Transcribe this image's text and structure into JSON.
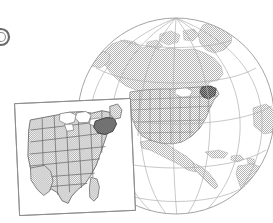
{
  "figure": {
    "title": "Globe showing North America with inset map of the eastern and central United States",
    "caption": "",
    "background_color": "#ffffff"
  },
  "marker": {
    "name": "figure-bullet-marker",
    "label": "",
    "shape": "circle-outline-cropped",
    "color": "#6b6b6b",
    "center_x": 1,
    "center_y": 37,
    "radius": 8
  },
  "globe": {
    "label": "Earth globe, North America centered",
    "center_x": 176,
    "center_y": 116,
    "radius": 98,
    "outline_color": "#9a9a9a",
    "ocean_color": "#ffffff",
    "land_color": "#c9c9c9",
    "graticule_color": "#b0b0b0",
    "graticule": {
      "meridian_count": 7,
      "parallel_count": 5,
      "pole_visible": true,
      "pole_label": "north-pole-convergence"
    },
    "landmasses": [
      "Greenland",
      "Canada",
      "Alaska",
      "Arctic islands",
      "United States",
      "Mexico",
      "Central America",
      "Caribbean islands",
      "South America (northern edge)"
    ],
    "country_overlay": {
      "label": "United States state boundaries",
      "fill_color": "#bcbcbc",
      "border_color": "#6e6e6e",
      "highlight_state": "New York",
      "highlight_color": "#575757"
    }
  },
  "inset": {
    "label": "Inset map of the eastern and central United States",
    "frame_color": "#8c8c8c",
    "frame_fill": "#ffffff",
    "rotation_deg": -3,
    "left": 16,
    "top": 100,
    "width": 118,
    "height": 114,
    "states_fill": "#c2c2c2",
    "states_border": "#5f5f5f",
    "lakes_fill": "#ffffff",
    "lakes_label": "Great Lakes",
    "highlight_state": "New York",
    "highlight_color": "#4f4f4f",
    "region_label": "Eastern and Central United States"
  },
  "legend": {
    "visible": false,
    "entries": []
  },
  "annotations": []
}
